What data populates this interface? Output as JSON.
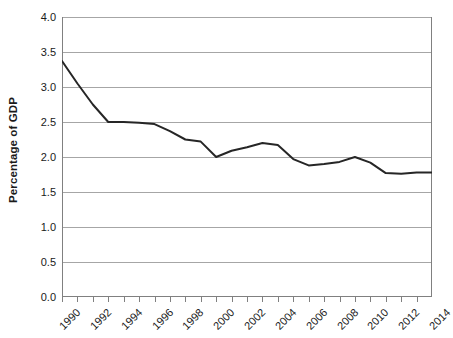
{
  "chart_data": {
    "type": "line",
    "title": "",
    "xlabel": "",
    "ylabel": "Percentage of GDP",
    "ylim": [
      0.0,
      4.0
    ],
    "xlim": [
      1990,
      2014
    ],
    "y_ticks": [
      "0.0",
      "0.5",
      "1.0",
      "1.5",
      "2.0",
      "2.5",
      "3.0",
      "3.5",
      "4.0"
    ],
    "y_tick_values": [
      0.0,
      0.5,
      1.0,
      1.5,
      2.0,
      2.5,
      3.0,
      3.5,
      4.0
    ],
    "x_tick_labels": [
      "1990",
      "1992",
      "1994",
      "1996",
      "1998",
      "2000",
      "2002",
      "2004",
      "2006",
      "2008",
      "2010",
      "2012",
      "2014"
    ],
    "x_tick_label_values": [
      1990,
      1992,
      1994,
      1996,
      1998,
      2000,
      2002,
      2004,
      2006,
      2008,
      2010,
      2012,
      2014
    ],
    "x_minor_ticks": [
      1990,
      1991,
      1992,
      1993,
      1994,
      1995,
      1996,
      1997,
      1998,
      1999,
      2000,
      2001,
      2002,
      2003,
      2004,
      2005,
      2006,
      2007,
      2008,
      2009,
      2010,
      2011,
      2012,
      2013,
      2014
    ],
    "grid": "horizontal",
    "legend": "none",
    "x": [
      1990,
      1991,
      1992,
      1993,
      1994,
      1995,
      1996,
      1997,
      1998,
      1999,
      2000,
      2001,
      2002,
      2003,
      2004,
      2005,
      2006,
      2007,
      2008,
      2009,
      2010,
      2011,
      2012,
      2013,
      2014
    ],
    "values": [
      3.37,
      3.05,
      2.75,
      2.5,
      2.5,
      2.49,
      2.47,
      2.37,
      2.25,
      2.22,
      2.0,
      2.09,
      2.14,
      2.2,
      2.17,
      1.97,
      1.88,
      1.9,
      1.93,
      2.0,
      1.92,
      1.77,
      1.76,
      1.78,
      1.78
    ],
    "series": [
      {
        "name": "Percentage of GDP",
        "values": [
          3.37,
          3.05,
          2.75,
          2.5,
          2.5,
          2.49,
          2.47,
          2.37,
          2.25,
          2.22,
          2.0,
          2.09,
          2.14,
          2.2,
          2.17,
          1.97,
          1.88,
          1.9,
          1.93,
          2.0,
          1.92,
          1.77,
          1.76,
          1.78,
          1.78
        ],
        "color": "#262626"
      }
    ],
    "colors": {
      "line": "#262626",
      "grid": "#a6a6a6",
      "axis": "#808080",
      "background": "#ffffff",
      "text": "#1a1a1a"
    }
  }
}
